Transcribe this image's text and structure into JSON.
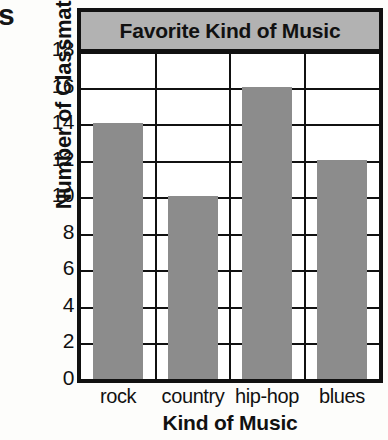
{
  "page": {
    "bleed_fragment": "s"
  },
  "chart_data": {
    "type": "bar",
    "title": "Favorite Kind of Music",
    "xlabel": "Kind of Music",
    "ylabel": "Number of Classmates",
    "categories": [
      "rock",
      "country",
      "hip-hop",
      "blues"
    ],
    "values": [
      14,
      10,
      16,
      12
    ],
    "ylim": [
      0,
      18
    ],
    "ytick_step": 2,
    "yticks": [
      "18",
      "16",
      "14",
      "12",
      "10",
      "8",
      "6",
      "4",
      "2",
      "0"
    ],
    "ytick_values": [
      18,
      16,
      14,
      12,
      10,
      8,
      6,
      4,
      2,
      0
    ],
    "grid": true,
    "legend": "none",
    "colors": {
      "bar": "#8c8c8c",
      "grid": "#111111",
      "frame": "#111111",
      "title_band": "#b2b2b2",
      "plot_background": "#ffffff",
      "text": "#111111"
    }
  }
}
